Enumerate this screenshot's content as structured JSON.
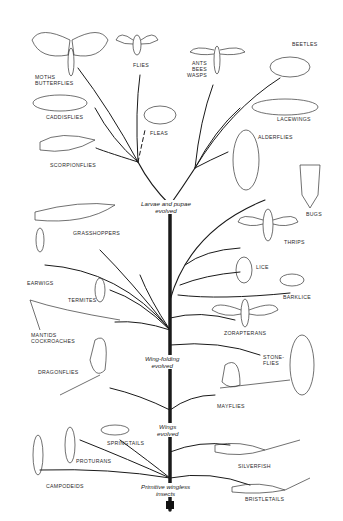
{
  "diagram": {
    "type": "phylogenetic-tree",
    "line_color": "#1a1a1a",
    "background": "#ffffff",
    "milestones": [
      {
        "id": "larvae",
        "text": "Larvae and pupae\nevolved"
      },
      {
        "id": "wingfold",
        "text": "Wing-folding\nevolved"
      },
      {
        "id": "wings",
        "text": "Wings\nevolved"
      },
      {
        "id": "primitive",
        "text": "Primitive wingless\ninsects"
      }
    ],
    "taxa": [
      {
        "id": "moths",
        "label": "Moths\nButterflies"
      },
      {
        "id": "flies",
        "label": "Flies"
      },
      {
        "id": "ants",
        "label": "Ants\nBees\nWasps"
      },
      {
        "id": "beetles",
        "label": "Beetles"
      },
      {
        "id": "caddisflies",
        "label": "Caddisflies"
      },
      {
        "id": "fleas",
        "label": "Fleas"
      },
      {
        "id": "lacewings",
        "label": "Lacewings"
      },
      {
        "id": "alderflies",
        "label": "Alderflies"
      },
      {
        "id": "scorpionflies",
        "label": "Scorpionflies"
      },
      {
        "id": "bugs",
        "label": "Bugs"
      },
      {
        "id": "grasshoppers",
        "label": "Grasshoppers"
      },
      {
        "id": "thrips",
        "label": "Thrips"
      },
      {
        "id": "earwigs",
        "label": "Earwigs"
      },
      {
        "id": "lice",
        "label": "Lice"
      },
      {
        "id": "termites",
        "label": "Termites"
      },
      {
        "id": "barklice",
        "label": "Barklice"
      },
      {
        "id": "mantids",
        "label": "Mantids\nCockroaches"
      },
      {
        "id": "zorapterans",
        "label": "Zorapterans"
      },
      {
        "id": "stoneflies",
        "label": "Stone-\nflies"
      },
      {
        "id": "dragonflies",
        "label": "Dragonflies"
      },
      {
        "id": "mayflies",
        "label": "Mayflies"
      },
      {
        "id": "springtails",
        "label": "Springtails"
      },
      {
        "id": "proturans",
        "label": "Proturans"
      },
      {
        "id": "silverfish",
        "label": "Silverfish"
      },
      {
        "id": "campodeids",
        "label": "Campodeids"
      },
      {
        "id": "bristletails",
        "label": "Bristletails"
      }
    ]
  }
}
